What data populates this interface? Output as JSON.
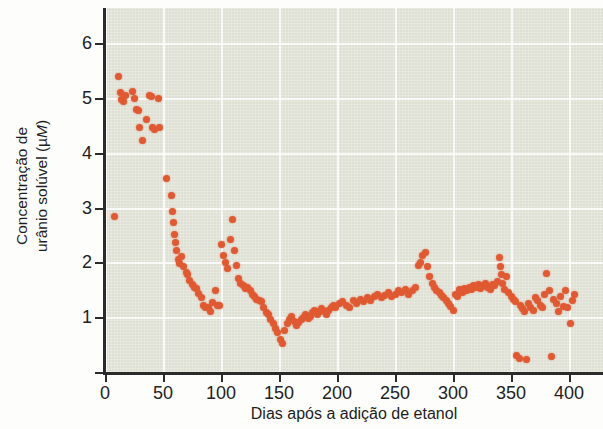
{
  "chart_data": {
    "type": "scatter",
    "title": "",
    "xlabel": "Dias após a adição de etanol",
    "ylabel": "Concentração de urânio solúvel (µM)",
    "ylabel_line1": "Concentração de",
    "ylabel_line2_prefix": "urânio solúvel (µ",
    "ylabel_line2_italic": "M",
    "ylabel_line2_suffix": ")",
    "xlim": [
      -8,
      420
    ],
    "ylim": [
      0,
      6.6
    ],
    "xticks": [
      0,
      50,
      100,
      150,
      200,
      250,
      300,
      350,
      400
    ],
    "xtick_labels": [
      "0",
      "50",
      "100",
      "150",
      "200",
      "250",
      "300",
      "350",
      "400"
    ],
    "yticks": [
      0,
      1,
      2,
      3,
      4,
      5,
      6
    ],
    "ytick_labels": [
      "0",
      "1",
      "2",
      "3",
      "4",
      "5",
      "6"
    ],
    "ytick_labels_shown": [
      "1",
      "2",
      "3",
      "4",
      "5",
      "6"
    ],
    "grid": true,
    "grid_color": "#ffffff",
    "plot_background": "#dfe0d4",
    "marker_color": "#df5a32",
    "marker_size": 7,
    "legend": null,
    "series": [
      {
        "name": "Urânio solúvel",
        "points": [
          [
            8,
            2.84
          ],
          [
            12,
            5.38
          ],
          [
            13,
            5.1
          ],
          [
            14,
            4.97
          ],
          [
            16,
            4.93
          ],
          [
            18,
            5.05
          ],
          [
            24,
            5.12
          ],
          [
            25,
            4.98
          ],
          [
            27,
            4.78
          ],
          [
            29,
            4.77
          ],
          [
            30,
            4.45
          ],
          [
            32,
            4.23
          ],
          [
            36,
            4.6
          ],
          [
            38,
            5.05
          ],
          [
            40,
            5.02
          ],
          [
            41,
            4.45
          ],
          [
            43,
            4.42
          ],
          [
            46,
            4.98
          ],
          [
            47,
            4.45
          ],
          [
            53,
            3.52
          ],
          [
            57,
            3.22
          ],
          [
            58,
            2.92
          ],
          [
            59,
            2.72
          ],
          [
            60,
            2.5
          ],
          [
            61,
            2.36
          ],
          [
            62,
            2.22
          ],
          [
            63,
            2.05
          ],
          [
            64,
            1.98
          ],
          [
            66,
            2.1
          ],
          [
            68,
            1.92
          ],
          [
            70,
            1.82
          ],
          [
            71,
            1.78
          ],
          [
            73,
            1.66
          ],
          [
            75,
            1.6
          ],
          [
            77,
            1.55
          ],
          [
            79,
            1.52
          ],
          [
            81,
            1.43
          ],
          [
            83,
            1.35
          ],
          [
            85,
            1.22
          ],
          [
            87,
            1.18
          ],
          [
            89,
            1.18
          ],
          [
            91,
            1.1
          ],
          [
            93,
            1.26
          ],
          [
            95,
            1.48
          ],
          [
            97,
            1.22
          ],
          [
            99,
            1.22
          ],
          [
            100,
            2.33
          ],
          [
            102,
            2.12
          ],
          [
            104,
            2.0
          ],
          [
            106,
            1.88
          ],
          [
            108,
            2.42
          ],
          [
            110,
            2.78
          ],
          [
            112,
            2.22
          ],
          [
            113,
            1.95
          ],
          [
            115,
            1.7
          ],
          [
            117,
            1.62
          ],
          [
            119,
            1.58
          ],
          [
            121,
            1.52
          ],
          [
            123,
            1.55
          ],
          [
            125,
            1.48
          ],
          [
            127,
            1.42
          ],
          [
            129,
            1.38
          ],
          [
            131,
            1.33
          ],
          [
            133,
            1.3
          ],
          [
            135,
            1.28
          ],
          [
            137,
            1.18
          ],
          [
            139,
            1.08
          ],
          [
            141,
            1.05
          ],
          [
            143,
            0.95
          ],
          [
            145,
            0.88
          ],
          [
            147,
            0.8
          ],
          [
            149,
            0.72
          ],
          [
            151,
            0.6
          ],
          [
            153,
            0.52
          ],
          [
            155,
            0.75
          ],
          [
            157,
            0.88
          ],
          [
            159,
            0.95
          ],
          [
            161,
            1.02
          ],
          [
            163,
            0.92
          ],
          [
            165,
            0.85
          ],
          [
            167,
            0.9
          ],
          [
            169,
            0.95
          ],
          [
            171,
            1.0
          ],
          [
            173,
            1.05
          ],
          [
            175,
            0.98
          ],
          [
            177,
            1.02
          ],
          [
            179,
            1.08
          ],
          [
            181,
            1.12
          ],
          [
            183,
            1.05
          ],
          [
            185,
            1.1
          ],
          [
            187,
            1.15
          ],
          [
            189,
            1.1
          ],
          [
            191,
            1.05
          ],
          [
            193,
            1.12
          ],
          [
            195,
            1.18
          ],
          [
            197,
            1.22
          ],
          [
            199,
            1.18
          ],
          [
            202,
            1.25
          ],
          [
            205,
            1.28
          ],
          [
            208,
            1.22
          ],
          [
            211,
            1.18
          ],
          [
            214,
            1.3
          ],
          [
            217,
            1.25
          ],
          [
            220,
            1.32
          ],
          [
            223,
            1.28
          ],
          [
            226,
            1.35
          ],
          [
            229,
            1.3
          ],
          [
            232,
            1.38
          ],
          [
            235,
            1.42
          ],
          [
            238,
            1.35
          ],
          [
            241,
            1.4
          ],
          [
            244,
            1.45
          ],
          [
            247,
            1.38
          ],
          [
            250,
            1.42
          ],
          [
            253,
            1.48
          ],
          [
            256,
            1.45
          ],
          [
            259,
            1.5
          ],
          [
            262,
            1.42
          ],
          [
            265,
            1.48
          ],
          [
            268,
            1.55
          ],
          [
            270,
            1.95
          ],
          [
            272,
            2.0
          ],
          [
            274,
            2.12
          ],
          [
            276,
            2.18
          ],
          [
            278,
            1.92
          ],
          [
            280,
            1.75
          ],
          [
            282,
            1.62
          ],
          [
            284,
            1.55
          ],
          [
            286,
            1.48
          ],
          [
            288,
            1.45
          ],
          [
            290,
            1.4
          ],
          [
            292,
            1.35
          ],
          [
            294,
            1.3
          ],
          [
            296,
            1.25
          ],
          [
            298,
            1.2
          ],
          [
            300,
            1.12
          ],
          [
            302,
            1.42
          ],
          [
            304,
            1.38
          ],
          [
            306,
            1.5
          ],
          [
            308,
            1.45
          ],
          [
            310,
            1.52
          ],
          [
            312,
            1.48
          ],
          [
            314,
            1.55
          ],
          [
            316,
            1.5
          ],
          [
            318,
            1.58
          ],
          [
            320,
            1.55
          ],
          [
            322,
            1.6
          ],
          [
            324,
            1.52
          ],
          [
            326,
            1.58
          ],
          [
            328,
            1.62
          ],
          [
            330,
            1.55
          ],
          [
            332,
            1.5
          ],
          [
            334,
            1.6
          ],
          [
            336,
            1.58
          ],
          [
            338,
            1.65
          ],
          [
            340,
            2.08
          ],
          [
            341,
            1.92
          ],
          [
            342,
            1.78
          ],
          [
            343,
            1.62
          ],
          [
            344,
            1.5
          ],
          [
            346,
            1.75
          ],
          [
            348,
            1.45
          ],
          [
            350,
            1.38
          ],
          [
            352,
            1.32
          ],
          [
            354,
            1.28
          ],
          [
            355,
            0.3
          ],
          [
            357,
            0.25
          ],
          [
            358,
            1.22
          ],
          [
            360,
            1.15
          ],
          [
            362,
            1.1
          ],
          [
            363,
            0.22
          ],
          [
            365,
            1.25
          ],
          [
            367,
            1.18
          ],
          [
            369,
            1.12
          ],
          [
            371,
            1.35
          ],
          [
            373,
            1.3
          ],
          [
            375,
            1.22
          ],
          [
            377,
            1.18
          ],
          [
            379,
            1.42
          ],
          [
            381,
            1.8
          ],
          [
            383,
            1.48
          ],
          [
            385,
            0.28
          ],
          [
            387,
            1.32
          ],
          [
            389,
            1.25
          ],
          [
            391,
            1.1
          ],
          [
            393,
            1.38
          ],
          [
            395,
            1.2
          ],
          [
            397,
            1.48
          ],
          [
            399,
            1.18
          ],
          [
            401,
            0.88
          ],
          [
            403,
            1.3
          ],
          [
            405,
            1.42
          ]
        ]
      }
    ]
  }
}
